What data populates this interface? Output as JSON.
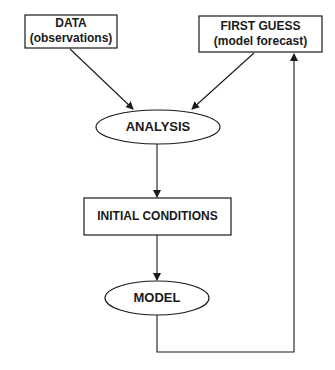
{
  "diagram": {
    "type": "flowchart",
    "colors": {
      "stroke": "#1a1a1a",
      "background": "#ffffff",
      "text": "#1a1a1a"
    },
    "nodes": {
      "data": {
        "shape": "rectangle",
        "title": "DATA",
        "subtitle": "(observations)"
      },
      "first_guess": {
        "shape": "rectangle",
        "title": "FIRST GUESS",
        "subtitle": "(model forecast)"
      },
      "analysis": {
        "shape": "ellipse",
        "title": "ANALYSIS"
      },
      "initial_conditions": {
        "shape": "rectangle",
        "title": "INITIAL CONDITIONS"
      },
      "model": {
        "shape": "ellipse",
        "title": "MODEL"
      }
    },
    "edges": [
      {
        "from": "DATA",
        "to": "ANALYSIS"
      },
      {
        "from": "FIRST GUESS",
        "to": "ANALYSIS"
      },
      {
        "from": "ANALYSIS",
        "to": "INITIAL CONDITIONS"
      },
      {
        "from": "INITIAL CONDITIONS",
        "to": "MODEL"
      },
      {
        "from": "MODEL",
        "to": "FIRST GUESS",
        "routing": "feedback loop via right side"
      }
    ]
  }
}
